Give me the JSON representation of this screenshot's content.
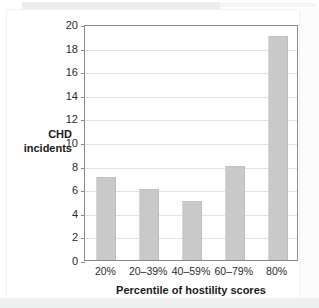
{
  "chart_data": {
    "type": "bar",
    "title": "",
    "subtitle": "",
    "categories": [
      "20%",
      "20–39%",
      "40–59%",
      "60–79%",
      "80%"
    ],
    "values": [
      7,
      6,
      5,
      8,
      19
    ],
    "series": [
      {
        "name": "CHD incidents",
        "values": [
          7,
          6,
          5,
          8,
          19
        ]
      }
    ],
    "xlabel": "Percentile of hostility scores",
    "ylabel": "CHD incidents",
    "ylabel_line1": "CHD",
    "ylabel_line2": "incidents",
    "ylim": [
      0,
      20
    ],
    "ytick_step": 2,
    "yticks": [
      0,
      2,
      4,
      6,
      8,
      10,
      12,
      14,
      16,
      18,
      20
    ],
    "ytick_labels": [
      "0",
      "2",
      "4",
      "6",
      "8",
      "10",
      "12",
      "14",
      "16",
      "18",
      "20"
    ],
    "grid": true,
    "grid_axis": "y",
    "legend": false,
    "legend_position": "none",
    "annotations": [],
    "colors": {
      "bar_fill": "#c9c9c9",
      "bar_edge": "#bdbdbd",
      "axis": "#8b8b8b",
      "gridline": "#e2e2e2",
      "text": "#1a1a1a",
      "background": "#ffffff"
    }
  }
}
